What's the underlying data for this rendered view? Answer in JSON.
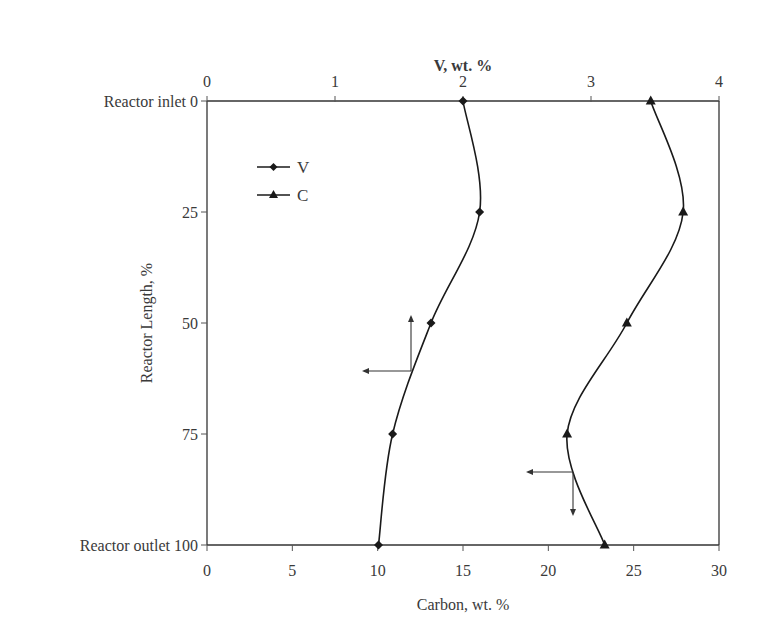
{
  "chart_data": {
    "type": "line",
    "orientation": "vertical-profile",
    "title": "",
    "top_axis": {
      "label": "V, wt. %",
      "range": [
        0,
        4
      ],
      "ticks": [
        0,
        1,
        2,
        3,
        4
      ]
    },
    "bottom_axis": {
      "label": "Carbon, wt. %",
      "range": [
        0,
        30
      ],
      "ticks": [
        0,
        5,
        10,
        15,
        20,
        25,
        30
      ]
    },
    "y_axis": {
      "label": "Reactor Length, %",
      "range": [
        0,
        100
      ],
      "inverted": true,
      "ticks": [
        0,
        25,
        50,
        75,
        100
      ],
      "tick_labels": [
        "Reactor inlet  0",
        "25",
        "50",
        "75",
        "Reactor outlet 100"
      ]
    },
    "y": [
      0,
      25,
      50,
      75,
      100
    ],
    "series": [
      {
        "name": "V",
        "axis": "top",
        "marker": "diamond",
        "values": [
          2.0,
          2.13,
          1.75,
          1.45,
          1.34
        ]
      },
      {
        "name": "C",
        "axis": "bottom",
        "marker": "triangle",
        "values": [
          26.0,
          27.9,
          24.6,
          21.1,
          23.3
        ]
      }
    ],
    "annotations": [
      {
        "type": "axis-arrow",
        "series": "V",
        "description": "arrow pointing to the left Y axis and up to top V axis",
        "at_y": 61,
        "at_x_top": 1.6
      },
      {
        "type": "axis-arrow",
        "series": "C",
        "description": "arrow pointing to left and down to bottom Carbon axis",
        "at_y": 84,
        "at_x_bottom": 21.5
      }
    ],
    "legend": {
      "position": "upper-left inside",
      "entries": [
        "V",
        "C"
      ]
    },
    "grid": false
  },
  "labels": {
    "top_axis_title": "V, wt. %",
    "bottom_axis_title": "Carbon, wt. %",
    "y_axis_title": "Reactor Length, %",
    "legend_v": "V",
    "legend_c": "C"
  }
}
